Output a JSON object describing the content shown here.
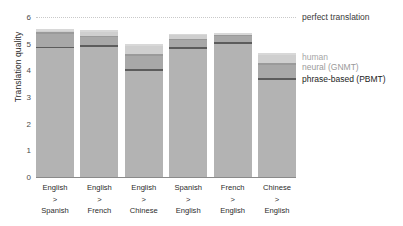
{
  "chart_data": {
    "type": "bar",
    "stacked_cumulative": true,
    "title": "",
    "xlabel": "",
    "ylabel": "Translation quality",
    "ylim": [
      0,
      6
    ],
    "yticks": [
      0,
      1,
      2,
      3,
      4,
      5,
      6
    ],
    "ytick_labels": [
      "0",
      "1",
      "2",
      "3",
      "4",
      "5",
      "6"
    ],
    "grid": false,
    "legend_position": "right",
    "categories": [
      "English > Spanish",
      "English > French",
      "English > Chinese",
      "Spanish > English",
      "French > English",
      "Chinese > English"
    ],
    "category_lines": [
      [
        "English",
        ">",
        "Spanish"
      ],
      [
        "English",
        ">",
        "French"
      ],
      [
        "English",
        ">",
        "Chinese"
      ],
      [
        "Spanish",
        ">",
        "English"
      ],
      [
        "French",
        ">",
        "English"
      ],
      [
        "Chinese",
        ">",
        "English"
      ]
    ],
    "series": [
      {
        "name": "phrase-based (PBMT)",
        "color": "#5c5c5c",
        "values": [
          4.885,
          4.932,
          4.035,
          4.872,
          5.046,
          3.694
        ]
      },
      {
        "name": "neural (GNMT)",
        "color": "#9a9a9a",
        "values": [
          5.428,
          5.295,
          4.594,
          5.187,
          5.343,
          4.263
        ]
      },
      {
        "name": "human",
        "color": "#cfcfcf",
        "values": [
          5.55,
          5.496,
          4.987,
          5.372,
          5.404,
          4.636
        ]
      }
    ],
    "reference_line": {
      "label": "perfect translation",
      "value": 6,
      "style": "dotted",
      "color": "#c9c9c9"
    },
    "annotations": [
      {
        "name": "human",
        "value": 5.55
      },
      {
        "name": "neural (GNMT)",
        "value": 5.43
      },
      {
        "name": "phrase-based (PBMT)",
        "value": 4.89
      }
    ]
  },
  "legend": {
    "perfect": "perfect translation",
    "human": "human",
    "gnmt": "neural (GNMT)",
    "pbmt": "phrase-based (PBMT)"
  }
}
